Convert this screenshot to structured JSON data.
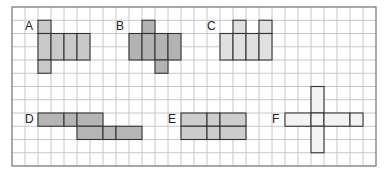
{
  "grid": {
    "left": 12,
    "top": 7,
    "cols": 28,
    "rows": 12,
    "cell_w": 13,
    "cell_h": 13.25,
    "line_color": "#c8c8c8",
    "border_color": "#707070"
  },
  "shapes": [
    {
      "label": "A",
      "fill": "#c9c9c9",
      "label_pos": [
        25,
        20
      ],
      "cells": [
        [
          2,
          1
        ],
        [
          2,
          2
        ],
        [
          3,
          2
        ],
        [
          4,
          2
        ],
        [
          5,
          2
        ],
        [
          2,
          3
        ],
        [
          3,
          3
        ],
        [
          4,
          3
        ],
        [
          5,
          3
        ],
        [
          2,
          4
        ]
      ],
      "rects": [
        [
          2,
          1,
          1,
          1
        ],
        [
          2,
          2,
          1,
          2
        ],
        [
          3,
          2,
          1,
          2
        ],
        [
          4,
          2,
          1,
          2
        ],
        [
          5,
          2,
          1,
          2
        ],
        [
          2,
          4,
          1,
          1
        ]
      ]
    },
    {
      "label": "B",
      "fill": "#b3b3b3",
      "label_pos": [
        116,
        20
      ],
      "rects": [
        [
          10,
          1,
          1,
          1
        ],
        [
          9,
          2,
          1,
          2
        ],
        [
          10,
          2,
          1,
          2
        ],
        [
          11,
          2,
          1,
          2
        ],
        [
          12,
          2,
          1,
          2
        ],
        [
          11,
          4,
          1,
          1
        ]
      ]
    },
    {
      "label": "C",
      "fill": "#e0e0e0",
      "label_pos": [
        207,
        20
      ],
      "rects": [
        [
          17,
          1,
          1,
          1
        ],
        [
          19,
          1,
          1,
          1
        ],
        [
          16,
          2,
          1,
          2
        ],
        [
          17,
          2,
          1,
          2
        ],
        [
          18,
          2,
          1,
          2
        ],
        [
          19,
          2,
          1,
          2
        ]
      ]
    },
    {
      "label": "D",
      "fill": "#b5b5b5",
      "label_pos": [
        25,
        113
      ],
      "rects": [
        [
          2,
          8,
          2,
          1
        ],
        [
          4,
          8,
          1,
          1
        ],
        [
          5,
          8,
          2,
          1
        ],
        [
          5,
          9,
          2,
          1
        ],
        [
          7,
          9,
          1,
          1
        ],
        [
          8,
          9,
          2,
          1
        ]
      ]
    },
    {
      "label": "E",
      "fill": "#cdcdcd",
      "label_pos": [
        168,
        113
      ],
      "rects": [
        [
          13,
          8,
          2,
          1
        ],
        [
          15,
          8,
          1,
          1
        ],
        [
          16,
          8,
          2,
          1
        ],
        [
          13,
          9,
          2,
          1
        ],
        [
          15,
          9,
          1,
          1
        ],
        [
          16,
          9,
          2,
          1
        ]
      ]
    },
    {
      "label": "F",
      "fill": "#f3f3f3",
      "label_pos": [
        272,
        113
      ],
      "rects": [
        [
          23,
          6,
          1,
          2
        ],
        [
          21,
          8,
          2,
          1
        ],
        [
          23,
          8,
          1,
          1
        ],
        [
          24,
          8,
          2,
          1
        ],
        [
          26,
          8,
          1,
          1
        ],
        [
          23,
          9,
          1,
          2
        ]
      ]
    }
  ]
}
